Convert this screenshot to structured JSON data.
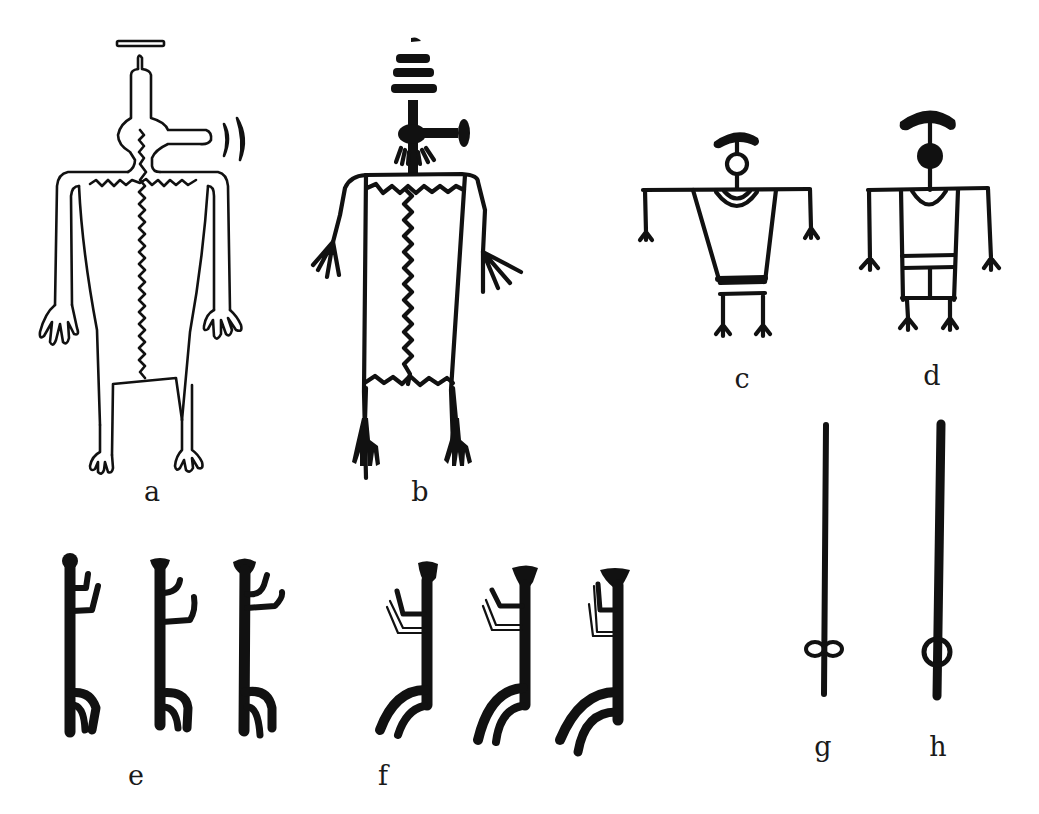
{
  "figure": {
    "type": "petroglyph figure plate",
    "background": "#ffffff",
    "ink": "#111111",
    "panels": [
      {
        "id": "a",
        "label": "a",
        "description": "Outlined anthropomorph with antenna headdress, horizontal bar above head, snout projection and two crescents, zigzag body line, hands and feet with fingers"
      },
      {
        "id": "b",
        "label": "b",
        "description": "Solid-line anthropomorph with stacked horizontal bars headdress, T-shaped projection, zigzag body panel, fringed hands and solid feet"
      },
      {
        "id": "c",
        "label": "c",
        "description": "Stick figure with arc headdress, open circle head, trapezoidal body with necklace arc and waist band"
      },
      {
        "id": "d",
        "label": "d",
        "description": "Stick figure with arc headdress, solid circle head, rectangular body with necklace arc and divided lower panel"
      },
      {
        "id": "e",
        "label": "e",
        "description": "Three solid vertical figures with round heads, raised arms and bent legs"
      },
      {
        "id": "f",
        "label": "f",
        "description": "Three solid vertical figures with flared heads, outlined raised arms and curved legs"
      },
      {
        "id": "g",
        "label": "g",
        "description": "Thin vertical staff with open loop near base"
      },
      {
        "id": "h",
        "label": "h",
        "description": "Thick vertical staff with open ring near base"
      }
    ]
  }
}
